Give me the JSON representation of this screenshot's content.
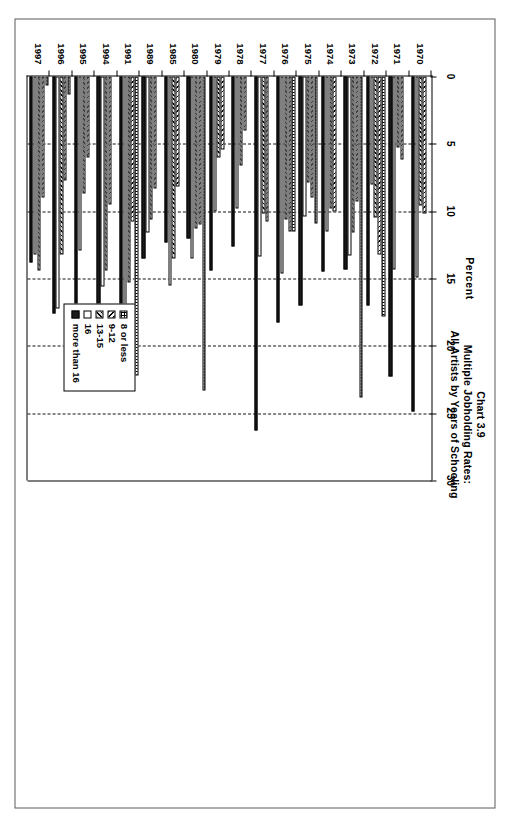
{
  "chart_data": {
    "type": "bar",
    "orientation": "horizontal",
    "title": "Chart 3.9",
    "subtitle_1": "Multiple Jobholding Rates:",
    "subtitle_2": "All Artists by Years of Schooling",
    "xlabel": "Percent",
    "ylabel": "",
    "xlim": [
      0,
      30
    ],
    "xticks": [
      0,
      5,
      10,
      15,
      20,
      25,
      30
    ],
    "xticklabels": [
      "0",
      "5",
      "10",
      "15",
      "20",
      "25",
      "30"
    ],
    "grid": true,
    "legend_position": "lower-right",
    "categories": [
      "1970",
      "1971",
      "1972",
      "1973",
      "1974",
      "1975",
      "1976",
      "1977",
      "1978",
      "1979",
      "1980",
      "1985",
      "1989",
      "1991",
      "1994",
      "1995",
      "1996",
      "1997"
    ],
    "series": [
      {
        "name": "8 or less",
        "pattern": "dotted",
        "values": [
          0.0,
          0.0,
          17.8,
          23.8,
          0.0,
          10.9,
          11.5,
          0.0,
          0.0,
          0.0,
          23.3,
          0.0,
          0.0,
          22.2,
          0.0,
          0.0,
          1.3,
          0.7
        ]
      },
      {
        "name": "9-12",
        "pattern": "hatch-fwd",
        "values": [
          10.2,
          6.2,
          13.2,
          9.3,
          10.0,
          9.0,
          11.5,
          10.8,
          4.0,
          5.4,
          11.0,
          8.2,
          8.3,
          10.8,
          9.5,
          6.0,
          7.7,
          9.0
        ]
      },
      {
        "name": "13-15",
        "pattern": "hatch-back",
        "values": [
          9.6,
          5.3,
          10.5,
          11.6,
          9.8,
          7.9,
          10.6,
          10.2,
          6.6,
          6.0,
          11.3,
          13.5,
          10.6,
          15.3,
          14.4,
          8.7,
          13.2,
          14.4
        ]
      },
      {
        "name": "16",
        "pattern": "white",
        "values": [
          14.9,
          14.3,
          8.0,
          13.3,
          11.5,
          10.4,
          14.6,
          13.4,
          9.8,
          10.0,
          13.5,
          15.5,
          11.6,
          17.9,
          15.6,
          12.9,
          17.2,
          13.2
        ]
      },
      {
        "name": "more than 16",
        "pattern": "solid",
        "values": [
          24.9,
          22.3,
          17.0,
          14.3,
          14.5,
          17.0,
          18.3,
          26.3,
          12.6,
          14.4,
          12.0,
          12.3,
          13.5,
          20.2,
          18.3,
          20.0,
          17.6,
          13.8
        ]
      }
    ]
  }
}
